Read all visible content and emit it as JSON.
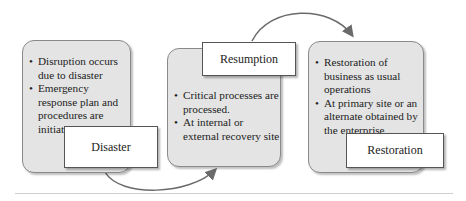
{
  "diagram": {
    "phases": [
      {
        "label": "Disaster",
        "bullets": [
          "Disruption occurs due to disaster",
          "Emergency response plan and procedures are initiated"
        ]
      },
      {
        "label": "Resumption",
        "bullets": [
          "Critical processes are processed.",
          "At internal or external recovery site"
        ]
      },
      {
        "label": "Restoration",
        "bullets": [
          "Restoration of business as usual operations",
          "At primary site or an alternate obtained by the enterprise"
        ]
      }
    ],
    "colors": {
      "box_fill": "#e4e4e4",
      "label_fill": "#ffffff",
      "arrow": "#6a6a6a"
    }
  }
}
